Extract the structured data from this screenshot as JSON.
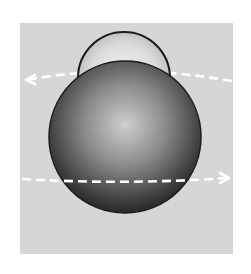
{
  "figure": {
    "panel": {
      "x": 20,
      "y": 23,
      "width": 213,
      "height": 231,
      "color": "#d6d6d6"
    },
    "large_sphere": {
      "cx": 125,
      "cy": 135,
      "r": 76,
      "highlight": "#cfcfcf",
      "shadow": "#2a2a2a"
    },
    "small_sphere": {
      "cx": 124,
      "cy": 73,
      "r": 46,
      "highlight": "#f2f2f2",
      "shadow": "#b8b8b8"
    },
    "arrows": [
      {
        "name": "upper-arrow",
        "direction": "left",
        "y_start": 73,
        "y_end": 80
      },
      {
        "name": "lower-arrow",
        "direction": "right",
        "y_start": 178,
        "y_end": 178
      }
    ],
    "colors": {
      "background": "#ffffff",
      "outline": "#1a1a1a",
      "arrow": "#ffffff"
    }
  }
}
